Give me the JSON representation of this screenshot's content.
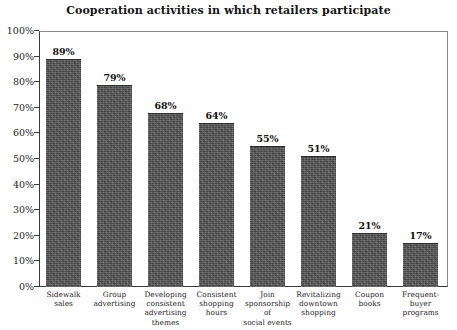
{
  "chart_data": {
    "type": "bar",
    "title": "Cooperation activities in which retailers participate",
    "xlabel": "",
    "ylabel": "",
    "ylim": [
      0,
      100
    ],
    "yticks": [
      "0%",
      "10%",
      "20%",
      "30%",
      "40%",
      "50%",
      "60%",
      "70%",
      "80%",
      "90%",
      "100%"
    ],
    "ytick_values": [
      0,
      10,
      20,
      30,
      40,
      50,
      60,
      70,
      80,
      90,
      100
    ],
    "grid": false,
    "legend": false,
    "categories": [
      "Sidewalk sales",
      "Group advertising",
      "Developing consistent advertising themes",
      "Consistent shopping hours",
      "Join sponsorship of social events",
      "Revitalizing downtown shopping",
      "Coupon books",
      "Frequent-buyer programs"
    ],
    "category_lines": [
      [
        "Sidewalk",
        "sales"
      ],
      [
        "Group",
        "advertising"
      ],
      [
        "Developing",
        "consistent",
        "advertising",
        "themes"
      ],
      [
        "Consistent",
        "shopping",
        "hours"
      ],
      [
        "Join",
        "sponsorship",
        "of",
        "social events"
      ],
      [
        "Revitalizing",
        "downtown",
        "shopping"
      ],
      [
        "Coupon",
        "books"
      ],
      [
        "Frequent-",
        "buyer",
        "programs"
      ]
    ],
    "values": [
      89,
      79,
      68,
      64,
      55,
      51,
      21,
      17
    ],
    "value_labels": [
      "89%",
      "79%",
      "68%",
      "64%",
      "55%",
      "51%",
      "21%",
      "17%"
    ],
    "bar_color": "#575757",
    "frame_color": "#3a3a3a",
    "text_color": "#1c1c1c"
  }
}
